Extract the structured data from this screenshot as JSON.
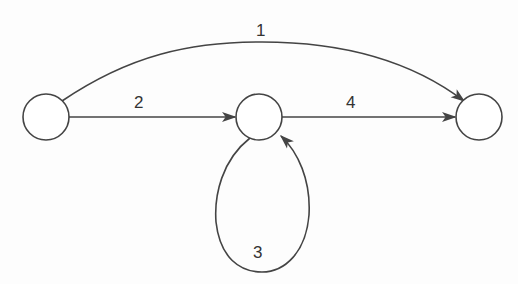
{
  "diagram": {
    "type": "directed-graph",
    "stroke_color": "#444444",
    "background_color": "#fdfdfd",
    "nodes": [
      {
        "id": "left",
        "label": "",
        "cx": 46,
        "cy": 117,
        "r": 23
      },
      {
        "id": "middle",
        "label": "",
        "cx": 259,
        "cy": 117,
        "r": 23
      },
      {
        "id": "right",
        "label": "",
        "cx": 479,
        "cy": 117,
        "r": 23
      }
    ],
    "edges": [
      {
        "id": "e1",
        "label": "1",
        "from": "left",
        "to": "right",
        "shape": "arc-over"
      },
      {
        "id": "e2",
        "label": "2",
        "from": "left",
        "to": "middle",
        "shape": "straight"
      },
      {
        "id": "e3",
        "label": "3",
        "from": "middle",
        "to": "middle",
        "shape": "self-loop-below"
      },
      {
        "id": "e4",
        "label": "4",
        "from": "middle",
        "to": "right",
        "shape": "straight"
      }
    ]
  }
}
